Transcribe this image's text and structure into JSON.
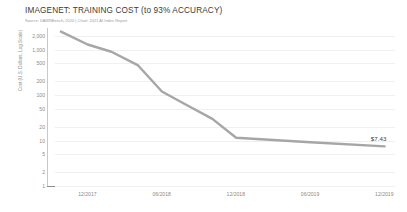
{
  "header": {
    "title": "IMAGENET: TRAINING COST (to 93% ACCURACY)",
    "source": "Source: DAWNBench, 2020 | Chart: 2021 AI Index Report"
  },
  "chart_data": {
    "type": "line",
    "title": "IMAGENET: TRAINING COST (to 93% ACCURACY)",
    "xlabel": "",
    "ylabel": "Cost (U.S. Dollars, Log Scale)",
    "yscale": "log",
    "ylim": [
      1,
      3000
    ],
    "grid": true,
    "legend": false,
    "y_ticks": [
      "2,000",
      "1,000",
      "500",
      "200",
      "100",
      "50",
      "20",
      "10",
      "5",
      "2",
      "1"
    ],
    "y_tick_values": [
      2000,
      1000,
      500,
      200,
      100,
      50,
      20,
      10,
      5,
      2,
      1
    ],
    "x_ticks": [
      "12/2017",
      "06/2018",
      "12/2018",
      "06/2019",
      "12/2019"
    ],
    "x_tick_values": [
      2017.958,
      2018.458,
      2018.958,
      2019.458,
      2019.958
    ],
    "xlim": [
      2017.74,
      2020.03
    ],
    "series": [
      {
        "name": "Training cost",
        "color": "#a6a6a6",
        "x": [
          2017.78,
          2017.96,
          2018.12,
          2018.3,
          2018.46,
          2018.62,
          2018.8,
          2018.96,
          2019.46,
          2019.96
        ],
        "values": [
          2500,
          1300,
          900,
          450,
          120,
          62,
          30,
          11.5,
          9.2,
          7.43
        ]
      }
    ],
    "annotations": [
      {
        "name": "end-value",
        "text": "$7.43",
        "x": 2019.96,
        "y": 7.43
      }
    ]
  }
}
